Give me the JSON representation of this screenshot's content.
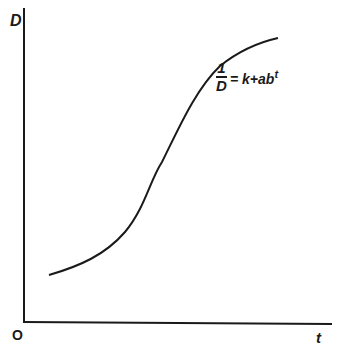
{
  "diagram": {
    "y_axis_label": "D",
    "x_axis_label": "t",
    "origin_label": "O",
    "equation": {
      "numerator": "1",
      "denominator": "D",
      "rhs": "= k+ab",
      "exponent": "t"
    },
    "curve_type": "sigmoid (Gompertz-type growth curve)",
    "line_color": "#1a1a1a"
  }
}
